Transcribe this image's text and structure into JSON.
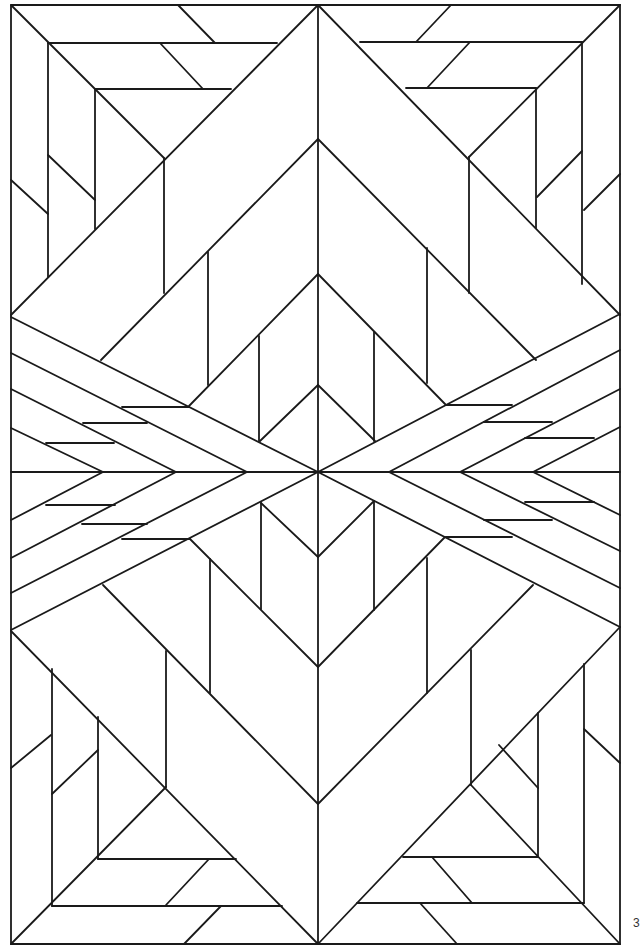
{
  "page": {
    "page_number": "3",
    "colors": {
      "background": "#ffffff",
      "line": "#1a1a1a"
    }
  },
  "artwork": {
    "description": "Geometric art-deco stained-glass style coloring pattern",
    "frame": [
      [
        11,
        5
      ],
      [
        620,
        5
      ],
      [
        620,
        944
      ],
      [
        11,
        944
      ],
      [
        11,
        5
      ]
    ],
    "lines": [
      [
        318,
        5,
        318,
        944
      ],
      [
        11,
        315,
        318,
        5
      ],
      [
        620,
        315,
        318,
        5
      ],
      [
        11,
        5,
        164,
        158
      ],
      [
        620,
        5,
        469,
        157
      ],
      [
        48,
        43,
        277,
        43
      ],
      [
        360,
        42,
        582,
        42
      ],
      [
        95,
        89,
        231,
        89
      ],
      [
        406,
        88,
        536,
        88
      ],
      [
        48,
        43,
        48,
        277
      ],
      [
        582,
        42,
        582,
        284
      ],
      [
        95,
        89,
        95,
        229
      ],
      [
        536,
        88,
        536,
        228
      ],
      [
        178,
        5,
        215,
        43
      ],
      [
        451,
        5,
        416,
        42
      ],
      [
        160,
        43,
        203,
        89
      ],
      [
        470,
        42,
        427,
        88
      ],
      [
        11,
        180,
        48,
        214
      ],
      [
        620,
        174,
        584,
        210
      ],
      [
        48,
        155,
        95,
        200
      ],
      [
        582,
        151,
        537,
        197
      ],
      [
        164,
        158,
        164,
        293
      ],
      [
        469,
        157,
        469,
        293
      ],
      [
        318,
        139,
        101,
        360
      ],
      [
        318,
        139,
        536,
        360
      ],
      [
        208,
        252,
        208,
        385
      ],
      [
        427,
        248,
        427,
        383
      ],
      [
        318,
        274,
        189,
        406
      ],
      [
        318,
        274,
        446,
        405
      ],
      [
        259,
        336,
        259,
        441
      ],
      [
        374,
        332,
        374,
        441
      ],
      [
        318,
        385,
        260,
        441
      ],
      [
        318,
        385,
        375,
        441
      ],
      [
        11,
        317,
        318,
        472
      ],
      [
        620,
        314,
        318,
        472
      ],
      [
        11,
        353,
        247,
        472
      ],
      [
        620,
        350,
        389,
        472
      ],
      [
        11,
        389,
        176,
        472
      ],
      [
        620,
        389,
        460,
        472
      ],
      [
        11,
        428,
        103,
        472
      ],
      [
        620,
        427,
        533,
        472
      ],
      [
        11,
        472,
        620,
        472
      ],
      [
        122,
        407,
        189,
        407
      ],
      [
        446,
        405,
        512,
        405
      ],
      [
        83,
        423,
        147,
        423
      ],
      [
        484,
        422,
        552,
        422
      ],
      [
        46,
        443,
        114,
        443
      ],
      [
        525,
        438,
        594,
        438
      ],
      [
        11,
        630,
        318,
        472
      ],
      [
        620,
        627,
        318,
        472
      ],
      [
        11,
        593,
        247,
        472
      ],
      [
        620,
        588,
        389,
        472
      ],
      [
        11,
        558,
        176,
        472
      ],
      [
        620,
        551,
        460,
        472
      ],
      [
        11,
        520,
        103,
        472
      ],
      [
        620,
        515,
        533,
        472
      ],
      [
        46,
        505,
        115,
        505
      ],
      [
        525,
        502,
        594,
        502
      ],
      [
        82,
        524,
        147,
        524
      ],
      [
        484,
        520,
        552,
        520
      ],
      [
        122,
        539,
        190,
        539
      ],
      [
        446,
        537,
        512,
        537
      ],
      [
        318,
        557,
        261,
        503
      ],
      [
        318,
        557,
        374,
        501
      ],
      [
        261,
        503,
        261,
        609
      ],
      [
        374,
        501,
        374,
        610
      ],
      [
        318,
        667,
        190,
        539
      ],
      [
        318,
        667,
        445,
        537
      ],
      [
        210,
        559,
        210,
        693
      ],
      [
        427,
        558,
        427,
        693
      ],
      [
        103,
        585,
        318,
        804
      ],
      [
        533,
        585,
        318,
        804
      ],
      [
        166,
        651,
        166,
        787
      ],
      [
        471,
        650,
        471,
        785
      ],
      [
        11,
        631,
        318,
        944
      ],
      [
        620,
        627,
        318,
        944
      ],
      [
        11,
        944,
        166,
        787
      ],
      [
        620,
        944,
        471,
        785
      ],
      [
        52,
        669,
        52,
        906
      ],
      [
        584,
        664,
        584,
        903
      ],
      [
        98,
        717,
        98,
        859
      ],
      [
        538,
        713,
        538,
        857
      ],
      [
        52,
        906,
        282,
        906
      ],
      [
        357,
        903,
        584,
        903
      ],
      [
        98,
        859,
        236,
        859
      ],
      [
        403,
        857,
        538,
        857
      ],
      [
        11,
        768,
        51,
        735
      ],
      [
        620,
        763,
        584,
        729
      ],
      [
        52,
        794,
        98,
        750
      ],
      [
        538,
        788,
        499,
        745
      ],
      [
        209,
        859,
        166,
        905
      ],
      [
        432,
        857,
        472,
        903
      ],
      [
        221,
        906,
        184,
        944
      ],
      [
        420,
        903,
        457,
        944
      ]
    ]
  }
}
